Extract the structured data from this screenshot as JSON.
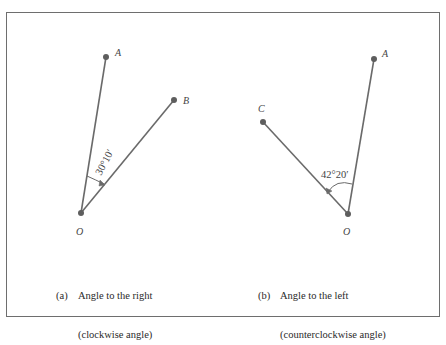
{
  "diagrams": [
    {
      "id": "a",
      "points": {
        "O": {
          "label": "O",
          "x": 81,
          "y": 213
        },
        "A": {
          "label": "A",
          "x": 106,
          "y": 57
        },
        "B": {
          "label": "B",
          "x": 174,
          "y": 100
        }
      },
      "angle_label": "30°10′",
      "caption_tag": "(a)",
      "caption_line1": "Angle to the right",
      "caption_line2": "(clockwise angle)"
    },
    {
      "id": "b",
      "points": {
        "O": {
          "label": "O",
          "x": 348,
          "y": 214
        },
        "A": {
          "label": "A",
          "x": 374,
          "y": 59
        },
        "C": {
          "label": "C",
          "x": 263,
          "y": 122
        }
      },
      "angle_label": "42°20′",
      "caption_tag": "(b)",
      "caption_line1": "Angle to the left",
      "caption_line2": "(counterclockwise angle)"
    }
  ],
  "colors": {
    "line": "#6a6a6a",
    "point": "#5e5e5e",
    "text": "#444444",
    "frame": "#6e6e6e"
  }
}
